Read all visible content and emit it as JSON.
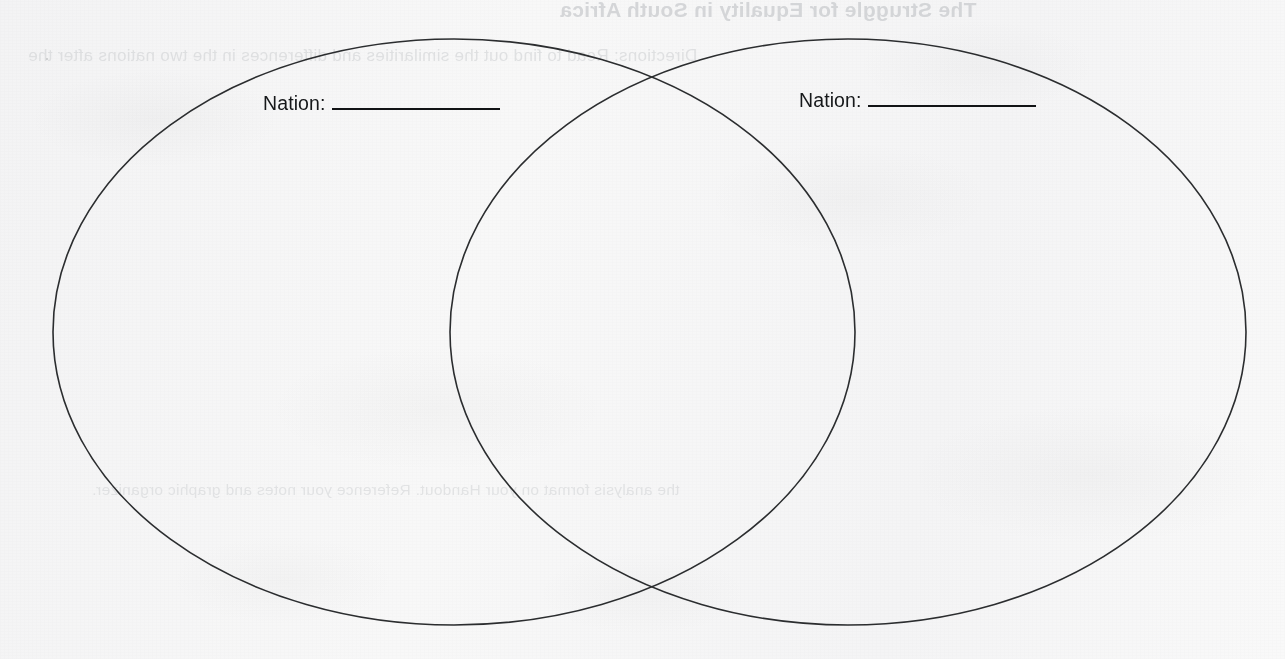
{
  "document": {
    "type": "worksheet",
    "orientation": "landscape",
    "background_color": "#fbfbfb",
    "ink_color": "#16181a",
    "stroke_color": "#2b2d2f"
  },
  "diagram": {
    "kind": "venn-diagram",
    "set_count": 2,
    "stroke_color": "#2b2d2f",
    "stroke_width": 1.6,
    "fill": "none",
    "left_ellipse": {
      "cx": 454,
      "cy": 332,
      "rx": 401,
      "ry": 293
    },
    "right_ellipse": {
      "cx": 848,
      "cy": 332,
      "rx": 398,
      "ry": 293
    },
    "intersection_points": [
      {
        "x": 652,
        "y": 81
      },
      {
        "x": 652,
        "y": 582
      }
    ]
  },
  "labels": {
    "left": {
      "prefix": "Nation:",
      "value": "",
      "placeholder": "",
      "rule_width_px": 168
    },
    "right": {
      "prefix": "Nation:",
      "value": "",
      "placeholder": "",
      "rule_width_px": 168
    }
  },
  "bleed_through": {
    "note": "faint mirrored show-through from the reverse side of the scanned page",
    "title": "The Struggle for Equality in South Africa",
    "subtitle": "Directions: Read to find out the similarities and differences in the two nations after the",
    "body": "the analysis format on your Handout. Reference your notes and graphic organizer."
  }
}
